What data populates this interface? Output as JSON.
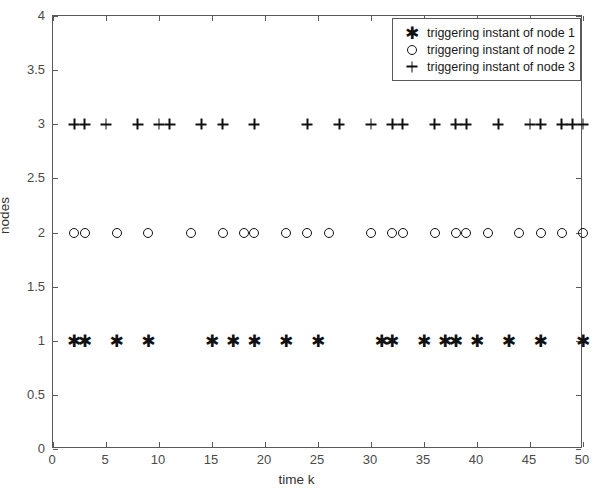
{
  "chart_data": {
    "type": "scatter",
    "title": "",
    "xlabel": "time k",
    "ylabel": "nodes",
    "xlim": [
      0,
      50
    ],
    "ylim": [
      0,
      4
    ],
    "xticks": [
      0,
      5,
      10,
      15,
      20,
      25,
      30,
      35,
      40,
      45,
      50
    ],
    "xtick_labels": [
      "0",
      "5",
      "10",
      "15",
      "20",
      "25",
      "30",
      "35",
      "40",
      "45",
      "50"
    ],
    "yticks": [
      0,
      0.5,
      1,
      1.5,
      2,
      2.5,
      3,
      3.5,
      4
    ],
    "ytick_labels": [
      "0",
      "0.5",
      "1",
      "1.5",
      "2",
      "2.5",
      "3",
      "3.5",
      "4"
    ],
    "grid": false,
    "legend_position": "upper right",
    "marker_color": "#111111",
    "series": [
      {
        "name": "triggering instant of node 1",
        "marker": "asterisk",
        "y": 1,
        "x": [
          2,
          3,
          6,
          9,
          15,
          17,
          19,
          22,
          25,
          31,
          32,
          35,
          37,
          38,
          40,
          43,
          46,
          50
        ],
        "values": [
          1,
          1,
          1,
          1,
          1,
          1,
          1,
          1,
          1,
          1,
          1,
          1,
          1,
          1,
          1,
          1,
          1,
          1
        ]
      },
      {
        "name": "triggering instant of node 2",
        "marker": "circle",
        "y": 2,
        "x": [
          2,
          3,
          6,
          9,
          13,
          16,
          18,
          19,
          22,
          24,
          26,
          30,
          32,
          33,
          36,
          38,
          39,
          41,
          44,
          46,
          48,
          50
        ],
        "values": [
          2,
          2,
          2,
          2,
          2,
          2,
          2,
          2,
          2,
          2,
          2,
          2,
          2,
          2,
          2,
          2,
          2,
          2,
          2,
          2,
          2,
          2
        ]
      },
      {
        "name": "triggering instant of node 3",
        "marker": "plus",
        "y": 3,
        "x": [
          2,
          3,
          5,
          8,
          10,
          11,
          14,
          16,
          19,
          24,
          27,
          30,
          32,
          33,
          36,
          38,
          39,
          42,
          45,
          46,
          48,
          49,
          50
        ],
        "values": [
          3,
          3,
          3,
          3,
          3,
          3,
          3,
          3,
          3,
          3,
          3,
          3,
          3,
          3,
          3,
          3,
          3,
          3,
          3,
          3,
          3,
          3,
          3
        ]
      }
    ]
  },
  "legend": {
    "entries": [
      {
        "label": "triggering instant of node 1",
        "marker": "asterisk"
      },
      {
        "label": "triggering instant of node 2",
        "marker": "circle"
      },
      {
        "label": "triggering instant of node 3",
        "marker": "plus"
      }
    ]
  }
}
